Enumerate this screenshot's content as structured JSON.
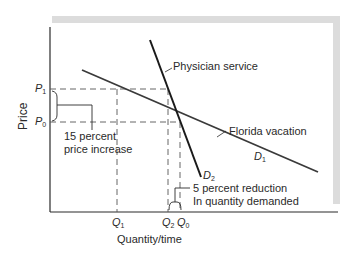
{
  "diagram": {
    "type": "supply-demand elasticity comparison",
    "axes": {
      "y_label": "Price",
      "x_label": "Quantity/time"
    },
    "price_ticks": [
      {
        "symbol": "P",
        "sub": "1"
      },
      {
        "symbol": "P",
        "sub": "0"
      }
    ],
    "quantity_ticks": [
      {
        "symbol": "Q",
        "sub": "1"
      },
      {
        "symbol": "Q",
        "sub": "2"
      },
      {
        "symbol": "Q",
        "sub": "0"
      }
    ],
    "curves": [
      {
        "id": "D1",
        "symbol": "D",
        "sub": "1",
        "label": "Florida vacation",
        "elasticity": "elastic"
      },
      {
        "id": "D2",
        "symbol": "D",
        "sub": "2",
        "label": "Physician service",
        "elasticity": "inelastic"
      }
    ],
    "annotations": {
      "price_change_line1": "15 percent",
      "price_change_line2": "price increase",
      "quantity_change_line1": "5 percent reduction",
      "quantity_change_line2": "In quantity demanded"
    },
    "colors": {
      "line": "#2a2a2a",
      "shadow": "#dcdcdc",
      "dash": "#555555"
    }
  }
}
